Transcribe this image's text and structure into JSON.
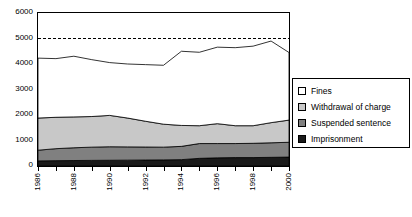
{
  "chart_data": {
    "type": "area",
    "title": "",
    "subtitle": "",
    "xlabel": "",
    "ylabel": "",
    "stacked": true,
    "grid": false,
    "legend_position": "right",
    "ylim": [
      0,
      6000
    ],
    "ytick_labels": [
      "0",
      "1000",
      "2000",
      "3000",
      "4000",
      "5000",
      "6000"
    ],
    "ytick_values": [
      0,
      1000,
      2000,
      3000,
      4000,
      5000,
      6000
    ],
    "x": [
      1986,
      1987,
      1988,
      1989,
      1990,
      1991,
      1992,
      1993,
      1994,
      1995,
      1996,
      1997,
      1998,
      1999,
      2000
    ],
    "xtick_labels": [
      "1986",
      "1988",
      "1990",
      "1992",
      "1994",
      "1996",
      "1998",
      "2000"
    ],
    "xtick_values": [
      1986,
      1988,
      1990,
      1992,
      1994,
      1996,
      1998,
      2000
    ],
    "xlim": [
      1986,
      2000
    ],
    "series": [
      {
        "name": "Imprisonment",
        "color": "#1a1a1a",
        "values": [
          200,
          210,
          215,
          220,
          225,
          230,
          235,
          240,
          250,
          300,
          320,
          330,
          330,
          340,
          350
        ]
      },
      {
        "name": "Suspended sentence",
        "color": "#808080",
        "values": [
          420,
          470,
          500,
          520,
          530,
          520,
          510,
          500,
          520,
          580,
          560,
          550,
          560,
          570,
          580
        ]
      },
      {
        "name": "Withdrawal of charge",
        "color": "#c8c8c8",
        "values": [
          1260,
          1230,
          1210,
          1200,
          1230,
          1130,
          1010,
          900,
          820,
          700,
          780,
          700,
          690,
          790,
          870
        ]
      },
      {
        "name": "Fines",
        "color": "#ffffff",
        "values": [
          2350,
          2300,
          2380,
          2230,
          2070,
          2120,
          2220,
          2310,
          2910,
          2880,
          3000,
          3060,
          3120,
          3200,
          2650
        ]
      }
    ],
    "cumulative_totals": [
      4230,
      4210,
      4305,
      4170,
      4055,
      4000,
      3975,
      3950,
      4500,
      4460,
      4660,
      4640,
      4700,
      4900,
      4450
    ],
    "reference_line": {
      "name": "reference",
      "value": 5000,
      "style": "dashed",
      "color": "#000000"
    }
  },
  "legend": {
    "items": [
      {
        "label": "Fines",
        "swatch": "#ffffff"
      },
      {
        "label": "Withdrawal of charge",
        "swatch": "#c8c8c8"
      },
      {
        "label": "Suspended sentence",
        "swatch": "#808080"
      },
      {
        "label": "Imprisonment",
        "swatch": "#1a1a1a"
      }
    ]
  }
}
